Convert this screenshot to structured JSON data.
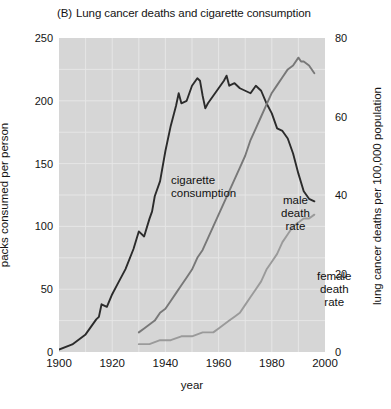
{
  "title": {
    "tag": "(B)",
    "text": "Lung cancer deaths and cigarette consumption"
  },
  "axes": {
    "left_title": "packs consumed per person",
    "right_title": "lung cancer deaths per 100,000 population",
    "x_title": "year",
    "left_ticks": [
      "0",
      "50",
      "100",
      "150",
      "200",
      "250"
    ],
    "right_ticks": [
      "0",
      "20",
      "40",
      "60",
      "80"
    ],
    "x_ticks": [
      "1900",
      "1920",
      "1940",
      "1960",
      "1980",
      "2000"
    ]
  },
  "series_labels": {
    "cigarette": "cigarette\nconsumption",
    "cigarette_line1": "cigarette",
    "cigarette_line2": "consumption",
    "male_line1": "male",
    "male_line2": "death",
    "male_line3": "rate",
    "female_line1": "female",
    "female_line2": "death",
    "female_line3": "rate"
  },
  "colors": {
    "plot_background": "#d6d6d6",
    "page_background": "#ffffff",
    "cigarette_line": "#2b2b2b",
    "male_line": "#7d7d7d",
    "female_line": "#9b9b9b",
    "grid": "#e8e8e8",
    "text": "#141414"
  },
  "chart_data": {
    "type": "line",
    "xlabel": "year",
    "ylabel": "packs consumed per person",
    "ylabel_right": "lung cancer deaths per 100,000 population",
    "xlim": [
      1900,
      2000
    ],
    "ylim": [
      0,
      250
    ],
    "ylim_right": [
      0,
      80
    ],
    "grid": true,
    "legend": "inline-annotations",
    "series": [
      {
        "name": "cigarette consumption",
        "axis": "left",
        "units": "packs consumed per person",
        "color": "#2b2b2b",
        "x": [
          1900,
          1905,
          1910,
          1912,
          1914,
          1915,
          1916,
          1918,
          1920,
          1922,
          1925,
          1928,
          1930,
          1932,
          1934,
          1935,
          1936,
          1938,
          1940,
          1942,
          1944,
          1945,
          1946,
          1948,
          1950,
          1952,
          1953,
          1954,
          1955,
          1956,
          1958,
          1960,
          1962,
          1963,
          1964,
          1966,
          1968,
          1970,
          1972,
          1974,
          1976,
          1978,
          1980,
          1982,
          1984,
          1986,
          1988,
          1990,
          1992,
          1994,
          1996
        ],
        "y": [
          2,
          6,
          14,
          20,
          26,
          28,
          38,
          36,
          46,
          54,
          66,
          82,
          96,
          92,
          106,
          112,
          124,
          136,
          160,
          180,
          196,
          206,
          198,
          200,
          212,
          218,
          216,
          204,
          194,
          198,
          204,
          210,
          216,
          220,
          212,
          214,
          210,
          208,
          206,
          212,
          208,
          198,
          190,
          178,
          176,
          170,
          158,
          142,
          128,
          122,
          120
        ]
      },
      {
        "name": "male death rate",
        "axis": "right",
        "units": "lung cancer deaths per 100,000 population",
        "color": "#7d7d7d",
        "x": [
          1930,
          1932,
          1934,
          1936,
          1938,
          1940,
          1942,
          1944,
          1946,
          1948,
          1950,
          1952,
          1954,
          1956,
          1958,
          1960,
          1962,
          1964,
          1966,
          1968,
          1970,
          1972,
          1974,
          1976,
          1978,
          1980,
          1982,
          1984,
          1986,
          1988,
          1990,
          1991,
          1992,
          1994,
          1996
        ],
        "y": [
          5,
          6,
          7,
          8,
          10,
          11,
          13,
          15,
          17,
          19,
          21,
          24,
          26,
          29,
          32,
          35,
          38,
          41,
          44,
          47,
          50,
          54,
          57,
          60,
          63,
          66,
          68,
          70,
          72,
          73,
          75,
          74,
          74,
          73,
          71
        ]
      },
      {
        "name": "female death rate",
        "axis": "right",
        "units": "lung cancer deaths per 100,000 population",
        "color": "#9b9b9b",
        "x": [
          1930,
          1934,
          1938,
          1942,
          1946,
          1950,
          1954,
          1958,
          1960,
          1962,
          1964,
          1966,
          1968,
          1970,
          1972,
          1974,
          1976,
          1978,
          1980,
          1982,
          1984,
          1986,
          1988,
          1990,
          1992,
          1994,
          1996
        ],
        "y": [
          2,
          2,
          3,
          3,
          4,
          4,
          5,
          5,
          6,
          7,
          8,
          9,
          10,
          12,
          14,
          16,
          18,
          21,
          23,
          25,
          28,
          30,
          32,
          33,
          34,
          34,
          35
        ]
      }
    ]
  }
}
